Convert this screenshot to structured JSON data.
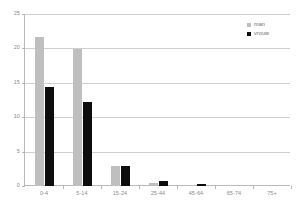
{
  "chart_data": {
    "type": "bar",
    "title": "",
    "subtitle": "",
    "xlabel": "",
    "ylabel": "",
    "categories": [
      "0-4",
      "5-14",
      "15-24",
      "25-44",
      "45-64",
      "65-74",
      "75+"
    ],
    "series": [
      {
        "name": "man",
        "color": "#bfbfbf",
        "values": [
          21.7,
          19.9,
          2.9,
          0.5,
          0.2,
          0,
          0
        ]
      },
      {
        "name": "vrouw",
        "color": "#0d0d0d",
        "values": [
          14.4,
          12.2,
          2.9,
          0.7,
          0.25,
          0,
          0
        ]
      }
    ],
    "ylim": [
      0,
      25
    ],
    "yticks": [
      0,
      5,
      10,
      15,
      20,
      25
    ],
    "ytick_labels": [
      "0",
      "5",
      "10",
      "15",
      "20",
      "25"
    ],
    "grid": true,
    "legend_position": "top-right",
    "orientation": "vertical",
    "grouping": "grouped"
  },
  "axis": {
    "y_tick_labels": [
      "0",
      "5",
      "10",
      "15",
      "20",
      "25"
    ],
    "x_tick_labels": [
      "0-4",
      "5-14",
      "15-24",
      "25-44",
      "45-64",
      "65-74",
      "75+"
    ]
  },
  "legend": {
    "items": [
      {
        "label": "man",
        "color": "#bfbfbf"
      },
      {
        "label": "vrouw",
        "color": "#0d0d0d"
      }
    ]
  },
  "colors": {
    "series_man": "#bfbfbf",
    "series_vrouw": "#0d0d0d",
    "gridline": "#cfcfcf",
    "axis": "#b9b9b9",
    "tick_text": "#8a8a8a",
    "legend_text": "#6f6f6f",
    "background": "#ffffff"
  }
}
